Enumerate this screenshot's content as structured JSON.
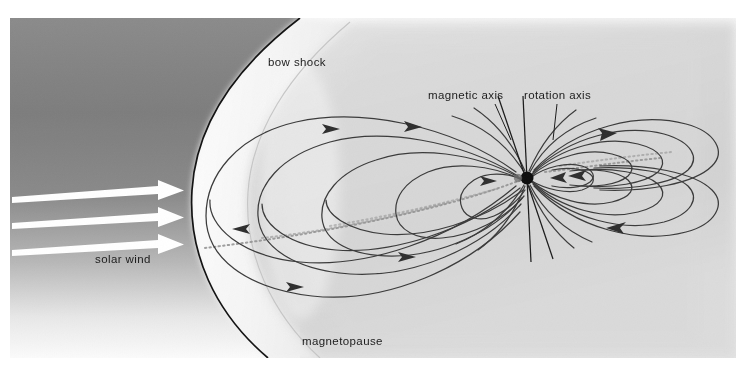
{
  "figure": {
    "canvas": {
      "width": 752,
      "height": 385
    },
    "content_bounds": {
      "x": 10,
      "y": 18,
      "width": 726,
      "height": 340
    }
  },
  "labels": {
    "bow_shock": "bow shock",
    "magnetic_axis": "magnetic axis",
    "rotation_axis": "rotation axis",
    "solar_wind": "solar wind",
    "magnetopause": "magnetopause"
  },
  "colors": {
    "background": "#ffffff",
    "solar_wind_region_dark": "#7b7b7b",
    "solar_wind_region_light": "#fbfbfb",
    "magnetosheath_band": "#f6f6f6",
    "magnetosphere_fill": "#d8d8d8",
    "magnetosphere_light": "#eaeaea",
    "bow_shock_line": "#121212",
    "field_line": "#3a3a3a",
    "axis_line": "#1a1a1a",
    "arrow_white": "#ffffff",
    "label_text": "#1a1a1a",
    "planet": "#0d0d0d",
    "plasma_sheet": "#9a9a9a"
  },
  "elements": {
    "planet": {
      "cx": 527,
      "cy": 178,
      "r": 6.5,
      "name": "planet-earth"
    },
    "rotation_axis_line": {
      "x1": 523,
      "y1": 96,
      "x2": 531,
      "y2": 262
    },
    "magnetic_axis_line": {
      "x1": 498,
      "y1": 96,
      "x2": 553,
      "y2": 259
    },
    "solar_wind_arrows": [
      {
        "x1": 12,
        "y1": 200,
        "x2": 183,
        "y2": 188
      },
      {
        "x1": 12,
        "y1": 225,
        "x2": 183,
        "y2": 215
      },
      {
        "x1": 12,
        "y1": 252,
        "x2": 183,
        "y2": 242
      }
    ],
    "label_positions": {
      "bow_shock": {
        "x": 268,
        "y": 65
      },
      "magnetic_axis": {
        "x": 428,
        "y": 98
      },
      "rotation_axis": {
        "x": 524,
        "y": 98
      },
      "solar_wind": {
        "x": 95,
        "y": 262
      },
      "magnetopause": {
        "x": 302,
        "y": 344
      }
    },
    "leader_lines": {
      "magnetic_axis": {
        "x1": 495,
        "y1": 104,
        "x2": 509,
        "y2": 136
      },
      "rotation_axis": {
        "x1": 556,
        "y1": 104,
        "x2": 552,
        "y2": 136
      }
    },
    "field_line_arrow_count": 8,
    "plasma_sheet_bands": 4
  }
}
